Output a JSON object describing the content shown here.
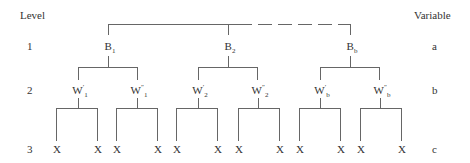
{
  "headers": {
    "level": "Level",
    "variable": "Variable"
  },
  "rows": [
    {
      "level": "1",
      "variable": "a"
    },
    {
      "level": "2",
      "variable": "b"
    },
    {
      "level": "3",
      "variable": "c"
    }
  ],
  "level1_nodes": [
    {
      "base": "B",
      "sub": "1"
    },
    {
      "base": "B",
      "sub": "2"
    },
    {
      "base": "B",
      "sub": "b"
    }
  ],
  "level2_nodes": [
    {
      "base": "W",
      "prime": "′",
      "sub": "1"
    },
    {
      "base": "W",
      "prime": "″",
      "sub": "1"
    },
    {
      "base": "W",
      "prime": "′",
      "sub": "2"
    },
    {
      "base": "W",
      "prime": "″",
      "sub": "2"
    },
    {
      "base": "W",
      "prime": "′",
      "sub": "b"
    },
    {
      "base": "W",
      "prime": "″",
      "sub": "b"
    }
  ],
  "leaf_label": "X",
  "colors": {
    "line": "#555555",
    "text": "#333333"
  }
}
